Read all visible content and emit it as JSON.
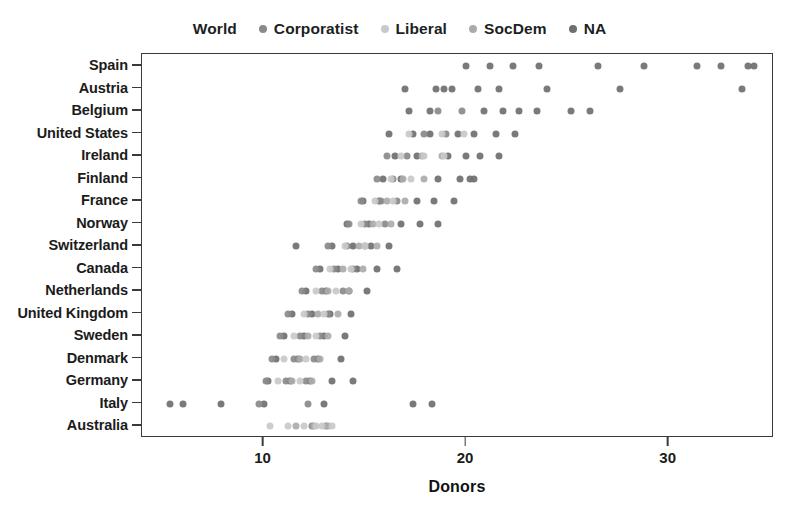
{
  "chart_data": {
    "type": "scatter",
    "title": "",
    "xlabel": "Donors",
    "ylabel": "",
    "xlim": [
      4.0,
      35.2
    ],
    "ylim_categories_top_to_bottom": true,
    "grid": false,
    "legend_position": "top-center",
    "xticks": [
      10,
      20,
      30
    ],
    "xtick_labels": [
      "10",
      "20",
      "30"
    ],
    "categories": [
      "Spain",
      "Austria",
      "Belgium",
      "United States",
      "Ireland",
      "Finland",
      "France",
      "Norway",
      "Switzerland",
      "Canada",
      "Netherlands",
      "United Kingdom",
      "Sweden",
      "Denmark",
      "Germany",
      "Italy",
      "Australia"
    ],
    "legend_entries": [
      {
        "label": "World",
        "color": "#ffffff",
        "show_dot": false
      },
      {
        "label": "Corporatist",
        "color": "#8a8a8a",
        "show_dot": true
      },
      {
        "label": "Liberal",
        "color": "#c9c9c9",
        "show_dot": true
      },
      {
        "label": "SocDem",
        "color": "#ababab",
        "show_dot": true
      },
      {
        "label": "NA",
        "color": "#6f6f6f",
        "show_dot": true
      }
    ],
    "series": [
      {
        "name": "NA",
        "color": "#6f6f6f",
        "points": [
          {
            "x": 20.0,
            "y": "Spain"
          },
          {
            "x": 21.2,
            "y": "Spain"
          },
          {
            "x": 22.3,
            "y": "Spain"
          },
          {
            "x": 23.6,
            "y": "Spain"
          },
          {
            "x": 26.5,
            "y": "Spain"
          },
          {
            "x": 28.8,
            "y": "Spain"
          },
          {
            "x": 31.4,
            "y": "Spain"
          },
          {
            "x": 32.6,
            "y": "Spain"
          },
          {
            "x": 33.9,
            "y": "Spain"
          },
          {
            "x": 34.2,
            "y": "Spain"
          },
          {
            "x": 19.3,
            "y": "Austria"
          },
          {
            "x": 20.6,
            "y": "Austria"
          },
          {
            "x": 21.6,
            "y": "Austria"
          },
          {
            "x": 24.0,
            "y": "Austria"
          },
          {
            "x": 27.6,
            "y": "Austria"
          },
          {
            "x": 33.6,
            "y": "Austria"
          },
          {
            "x": 17.0,
            "y": "Austria"
          },
          {
            "x": 18.5,
            "y": "Austria"
          },
          {
            "x": 18.9,
            "y": "Austria"
          },
          {
            "x": 22.6,
            "y": "Belgium"
          },
          {
            "x": 23.5,
            "y": "Belgium"
          },
          {
            "x": 21.8,
            "y": "Belgium"
          },
          {
            "x": 20.9,
            "y": "Belgium"
          },
          {
            "x": 18.2,
            "y": "Belgium"
          },
          {
            "x": 17.2,
            "y": "Belgium"
          },
          {
            "x": 25.2,
            "y": "Belgium"
          },
          {
            "x": 26.1,
            "y": "Belgium"
          },
          {
            "x": 19.6,
            "y": "United States"
          },
          {
            "x": 20.4,
            "y": "United States"
          },
          {
            "x": 21.5,
            "y": "United States"
          },
          {
            "x": 22.4,
            "y": "United States"
          },
          {
            "x": 18.2,
            "y": "United States"
          },
          {
            "x": 17.4,
            "y": "United States"
          },
          {
            "x": 16.2,
            "y": "United States"
          },
          {
            "x": 19.1,
            "y": "Ireland"
          },
          {
            "x": 20.0,
            "y": "Ireland"
          },
          {
            "x": 20.7,
            "y": "Ireland"
          },
          {
            "x": 21.6,
            "y": "Ireland"
          },
          {
            "x": 17.6,
            "y": "Ireland"
          },
          {
            "x": 16.5,
            "y": "Ireland"
          },
          {
            "x": 18.6,
            "y": "Finland"
          },
          {
            "x": 19.7,
            "y": "Finland"
          },
          {
            "x": 20.2,
            "y": "Finland"
          },
          {
            "x": 20.4,
            "y": "Finland"
          },
          {
            "x": 16.8,
            "y": "Finland"
          },
          {
            "x": 15.9,
            "y": "Finland"
          },
          {
            "x": 17.6,
            "y": "France"
          },
          {
            "x": 18.4,
            "y": "France"
          },
          {
            "x": 19.4,
            "y": "France"
          },
          {
            "x": 15.7,
            "y": "France"
          },
          {
            "x": 14.9,
            "y": "France"
          },
          {
            "x": 16.8,
            "y": "Norway"
          },
          {
            "x": 17.7,
            "y": "Norway"
          },
          {
            "x": 18.6,
            "y": "Norway"
          },
          {
            "x": 15.2,
            "y": "Norway"
          },
          {
            "x": 14.1,
            "y": "Norway"
          },
          {
            "x": 13.4,
            "y": "Switzerland"
          },
          {
            "x": 14.4,
            "y": "Switzerland"
          },
          {
            "x": 15.3,
            "y": "Switzerland"
          },
          {
            "x": 16.2,
            "y": "Switzerland"
          },
          {
            "x": 11.6,
            "y": "Switzerland"
          },
          {
            "x": 12.8,
            "y": "Canada"
          },
          {
            "x": 13.7,
            "y": "Canada"
          },
          {
            "x": 14.6,
            "y": "Canada"
          },
          {
            "x": 15.6,
            "y": "Canada"
          },
          {
            "x": 16.6,
            "y": "Canada"
          },
          {
            "x": 12.1,
            "y": "Netherlands"
          },
          {
            "x": 13.1,
            "y": "Netherlands"
          },
          {
            "x": 14.2,
            "y": "Netherlands"
          },
          {
            "x": 15.1,
            "y": "Netherlands"
          },
          {
            "x": 11.4,
            "y": "United Kingdom"
          },
          {
            "x": 12.4,
            "y": "United Kingdom"
          },
          {
            "x": 13.3,
            "y": "United Kingdom"
          },
          {
            "x": 14.3,
            "y": "United Kingdom"
          },
          {
            "x": 11.0,
            "y": "Sweden"
          },
          {
            "x": 12.0,
            "y": "Sweden"
          },
          {
            "x": 13.0,
            "y": "Sweden"
          },
          {
            "x": 14.0,
            "y": "Sweden"
          },
          {
            "x": 10.6,
            "y": "Denmark"
          },
          {
            "x": 11.7,
            "y": "Denmark"
          },
          {
            "x": 12.7,
            "y": "Denmark"
          },
          {
            "x": 13.8,
            "y": "Denmark"
          },
          {
            "x": 10.2,
            "y": "Germany"
          },
          {
            "x": 11.3,
            "y": "Germany"
          },
          {
            "x": 12.3,
            "y": "Germany"
          },
          {
            "x": 13.4,
            "y": "Germany"
          },
          {
            "x": 14.4,
            "y": "Germany"
          },
          {
            "x": 5.4,
            "y": "Italy"
          },
          {
            "x": 6.0,
            "y": "Italy"
          },
          {
            "x": 7.9,
            "y": "Italy"
          },
          {
            "x": 10.0,
            "y": "Italy"
          },
          {
            "x": 13.0,
            "y": "Italy"
          },
          {
            "x": 17.4,
            "y": "Italy"
          },
          {
            "x": 18.3,
            "y": "Italy"
          }
        ]
      },
      {
        "name": "Corporatist",
        "color": "#8a8a8a",
        "points": [
          {
            "x": 18.6,
            "y": "Belgium"
          },
          {
            "x": 19.8,
            "y": "Belgium"
          },
          {
            "x": 17.9,
            "y": "United States"
          },
          {
            "x": 19.0,
            "y": "United States"
          },
          {
            "x": 16.1,
            "y": "Ireland"
          },
          {
            "x": 17.1,
            "y": "Ireland"
          },
          {
            "x": 15.6,
            "y": "Finland"
          },
          {
            "x": 16.4,
            "y": "Finland"
          },
          {
            "x": 14.8,
            "y": "France"
          },
          {
            "x": 15.8,
            "y": "France"
          },
          {
            "x": 16.6,
            "y": "France"
          },
          {
            "x": 14.2,
            "y": "Norway"
          },
          {
            "x": 15.0,
            "y": "Norway"
          },
          {
            "x": 16.0,
            "y": "Norway"
          },
          {
            "x": 13.2,
            "y": "Switzerland"
          },
          {
            "x": 14.1,
            "y": "Switzerland"
          },
          {
            "x": 15.0,
            "y": "Switzerland"
          },
          {
            "x": 12.6,
            "y": "Canada"
          },
          {
            "x": 13.5,
            "y": "Canada"
          },
          {
            "x": 14.4,
            "y": "Canada"
          },
          {
            "x": 11.9,
            "y": "Netherlands"
          },
          {
            "x": 12.9,
            "y": "Netherlands"
          },
          {
            "x": 13.9,
            "y": "Netherlands"
          },
          {
            "x": 11.2,
            "y": "United Kingdom"
          },
          {
            "x": 12.2,
            "y": "United Kingdom"
          },
          {
            "x": 13.2,
            "y": "United Kingdom"
          },
          {
            "x": 10.8,
            "y": "Sweden"
          },
          {
            "x": 11.8,
            "y": "Sweden"
          },
          {
            "x": 12.8,
            "y": "Sweden"
          },
          {
            "x": 10.4,
            "y": "Denmark"
          },
          {
            "x": 11.5,
            "y": "Denmark"
          },
          {
            "x": 12.5,
            "y": "Denmark"
          },
          {
            "x": 10.1,
            "y": "Germany"
          },
          {
            "x": 11.1,
            "y": "Germany"
          },
          {
            "x": 12.1,
            "y": "Germany"
          },
          {
            "x": 9.8,
            "y": "Italy"
          },
          {
            "x": 12.2,
            "y": "Italy"
          },
          {
            "x": 12.4,
            "y": "Australia"
          },
          {
            "x": 13.1,
            "y": "Australia"
          }
        ]
      },
      {
        "name": "SocDem",
        "color": "#ababab",
        "points": [
          {
            "x": 17.8,
            "y": "Ireland"
          },
          {
            "x": 18.8,
            "y": "Ireland"
          },
          {
            "x": 16.9,
            "y": "Finland"
          },
          {
            "x": 17.9,
            "y": "Finland"
          },
          {
            "x": 16.1,
            "y": "France"
          },
          {
            "x": 17.0,
            "y": "France"
          },
          {
            "x": 15.4,
            "y": "Norway"
          },
          {
            "x": 16.3,
            "y": "Norway"
          },
          {
            "x": 14.7,
            "y": "Switzerland"
          },
          {
            "x": 15.6,
            "y": "Switzerland"
          },
          {
            "x": 13.9,
            "y": "Canada"
          },
          {
            "x": 14.9,
            "y": "Canada"
          },
          {
            "x": 13.2,
            "y": "Netherlands"
          },
          {
            "x": 14.2,
            "y": "Netherlands"
          },
          {
            "x": 12.7,
            "y": "United Kingdom"
          },
          {
            "x": 13.7,
            "y": "United Kingdom"
          },
          {
            "x": 12.2,
            "y": "Sweden"
          },
          {
            "x": 13.2,
            "y": "Sweden"
          },
          {
            "x": 11.8,
            "y": "Denmark"
          },
          {
            "x": 12.8,
            "y": "Denmark"
          },
          {
            "x": 11.4,
            "y": "Germany"
          },
          {
            "x": 12.4,
            "y": "Germany"
          },
          {
            "x": 11.6,
            "y": "Australia"
          },
          {
            "x": 12.5,
            "y": "Australia"
          },
          {
            "x": 13.2,
            "y": "Australia"
          }
        ]
      },
      {
        "name": "Liberal",
        "color": "#c9c9c9",
        "points": [
          {
            "x": 18.8,
            "y": "United States"
          },
          {
            "x": 19.9,
            "y": "United States"
          },
          {
            "x": 17.2,
            "y": "United States"
          },
          {
            "x": 17.9,
            "y": "Ireland"
          },
          {
            "x": 18.9,
            "y": "Ireland"
          },
          {
            "x": 16.8,
            "y": "Ireland"
          },
          {
            "x": 16.3,
            "y": "Finland"
          },
          {
            "x": 17.3,
            "y": "Finland"
          },
          {
            "x": 15.5,
            "y": "France"
          },
          {
            "x": 16.4,
            "y": "France"
          },
          {
            "x": 14.8,
            "y": "Norway"
          },
          {
            "x": 15.7,
            "y": "Norway"
          },
          {
            "x": 14.0,
            "y": "Switzerland"
          },
          {
            "x": 15.0,
            "y": "Switzerland"
          },
          {
            "x": 13.3,
            "y": "Canada"
          },
          {
            "x": 14.3,
            "y": "Canada"
          },
          {
            "x": 12.6,
            "y": "Netherlands"
          },
          {
            "x": 13.6,
            "y": "Netherlands"
          },
          {
            "x": 12.0,
            "y": "United Kingdom"
          },
          {
            "x": 13.0,
            "y": "United Kingdom"
          },
          {
            "x": 11.5,
            "y": "Sweden"
          },
          {
            "x": 12.6,
            "y": "Sweden"
          },
          {
            "x": 11.0,
            "y": "Denmark"
          },
          {
            "x": 12.1,
            "y": "Denmark"
          },
          {
            "x": 10.7,
            "y": "Germany"
          },
          {
            "x": 11.8,
            "y": "Germany"
          },
          {
            "x": 10.3,
            "y": "Australia"
          },
          {
            "x": 11.2,
            "y": "Australia"
          },
          {
            "x": 12.0,
            "y": "Australia"
          },
          {
            "x": 12.6,
            "y": "Australia"
          },
          {
            "x": 12.9,
            "y": "Australia"
          },
          {
            "x": 13.4,
            "y": "Australia"
          }
        ]
      }
    ]
  }
}
